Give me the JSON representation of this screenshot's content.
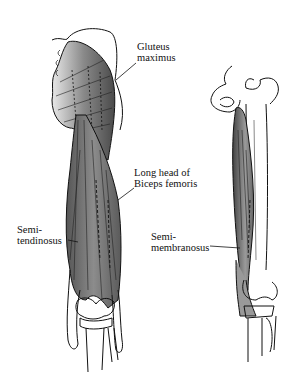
{
  "figure": {
    "labels": {
      "gluteus_maximus": "Gluteus\nmaximus",
      "biceps_femoris": "Long head of\nBiceps femoris",
      "semitendinosus": "Semi-\ntendinosus",
      "semimembranosus": "Semi-\nmembranosus"
    }
  }
}
